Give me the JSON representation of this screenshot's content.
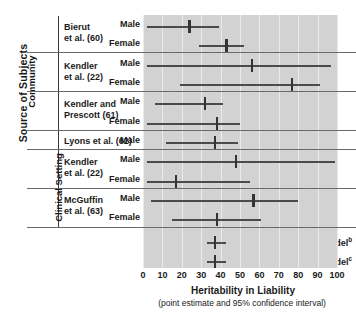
{
  "axes": {
    "y_title": "Source of Subjects",
    "x_title": "Heritability in Liability",
    "x_subtitle": "(point estimate and 95% confidence interval)",
    "x_ticks": [
      "0",
      "10",
      "20",
      "30",
      "40",
      "50",
      "60",
      "70",
      "80",
      "90",
      "100"
    ],
    "x_min": 0,
    "x_max": 100,
    "panel_color": "#d2d2d2",
    "grid_color": "#ebebeb",
    "marker_color": "#333333",
    "line_color": "#4a4a4a"
  },
  "groups": [
    {
      "label": "Community",
      "row_start": 0,
      "row_end": 6
    },
    {
      "label": "Clinical Setting",
      "row_start": 7,
      "row_end": 10
    }
  ],
  "studies": [
    {
      "name": "Bierut\net al. (60)",
      "line1": "Bierut",
      "line2": "et al. (60)",
      "rows": [
        0,
        1
      ]
    },
    {
      "name": "Kendler\net al. (22)",
      "line1": "Kendler",
      "line2": "et al. (22)",
      "rows": [
        2,
        3
      ]
    },
    {
      "name": "Kendler and\nPrescott (61)",
      "line1": "Kendler and",
      "line2": "Prescott (61)",
      "rows": [
        4,
        5
      ]
    },
    {
      "name": "Lyons et al. (62)",
      "line1": "Lyons et al. (62)",
      "line2": "",
      "rows": [
        6
      ]
    },
    {
      "name": "Kendler\net al. (22)",
      "line1": "Kendler",
      "line2": "et al. (22)",
      "rows": [
        7,
        8
      ]
    },
    {
      "name": "McGuffin\net al. (63)",
      "line1": "McGuffin",
      "line2": "et al. (63)",
      "rows": [
        9,
        10
      ]
    }
  ],
  "summary_rows": [
    {
      "label": "Full model",
      "sup": "b"
    },
    {
      "label": "Best-fitting model",
      "sup": "c"
    }
  ],
  "chart_data": {
    "type": "scatter",
    "title": "",
    "xlabel": "Heritability in Liability (point estimate and 95% confidence interval)",
    "ylabel": "Source of Subjects",
    "xlim": [
      0,
      100
    ],
    "x_ticks": [
      0,
      10,
      20,
      30,
      40,
      50,
      60,
      70,
      80,
      90,
      100
    ],
    "grid": "vertical",
    "legend": "none",
    "series": [
      {
        "study": "Bierut et al. (60)",
        "setting": "Community",
        "sex": "Male",
        "estimate": 24,
        "ci_low": 2,
        "ci_high": 39
      },
      {
        "study": "Bierut et al. (60)",
        "setting": "Community",
        "sex": "Female",
        "estimate": 43,
        "ci_low": 29,
        "ci_high": 52
      },
      {
        "study": "Kendler et al. (22)",
        "setting": "Community",
        "sex": "Male",
        "estimate": 56,
        "ci_low": 2,
        "ci_high": 97
      },
      {
        "study": "Kendler et al. (22)",
        "setting": "Community",
        "sex": "Female",
        "estimate": 77,
        "ci_low": 19,
        "ci_high": 91
      },
      {
        "study": "Kendler and Prescott (61)",
        "setting": "Community",
        "sex": "Male",
        "estimate": 32,
        "ci_low": 6,
        "ci_high": 41
      },
      {
        "study": "Kendler and Prescott (61)",
        "setting": "Community",
        "sex": "Female",
        "estimate": 38,
        "ci_low": 2,
        "ci_high": 50
      },
      {
        "study": "Lyons et al. (62)",
        "setting": "Community",
        "sex": "Male",
        "estimate": 37,
        "ci_low": 12,
        "ci_high": 49
      },
      {
        "study": "Kendler et al. (22)",
        "setting": "Clinical Setting",
        "sex": "Male",
        "estimate": 48,
        "ci_low": 2,
        "ci_high": 99
      },
      {
        "study": "Kendler et al. (22)",
        "setting": "Clinical Setting",
        "sex": "Female",
        "estimate": 17,
        "ci_low": 2,
        "ci_high": 55
      },
      {
        "study": "McGuffin et al. (63)",
        "setting": "Clinical Setting",
        "sex": "Male",
        "estimate": 57,
        "ci_low": 4,
        "ci_high": 80
      },
      {
        "study": "McGuffin et al. (63)",
        "setting": "Clinical Setting",
        "sex": "Female",
        "estimate": 38,
        "ci_low": 15,
        "ci_high": 61
      },
      {
        "study": "Full model",
        "setting": "Pooled",
        "sex": "",
        "estimate": 37,
        "ci_low": 33,
        "ci_high": 43
      },
      {
        "study": "Best-fitting model",
        "setting": "Pooled",
        "sex": "",
        "estimate": 37,
        "ci_low": 33,
        "ci_high": 43
      }
    ]
  },
  "layout": {
    "panel_left": 143,
    "panel_top": 15,
    "panel_width": 194,
    "panel_height": 253,
    "row_tops": [
      18,
      37,
      57,
      76,
      95,
      115,
      134,
      153,
      173,
      192,
      211,
      234,
      253
    ],
    "row_height": 19,
    "separators_y": [
      52,
      91,
      130,
      149,
      188,
      227
    ],
    "sex_labels": [
      "Male",
      "Female",
      "Male",
      "Female",
      "Male",
      "Female",
      "Male",
      "Male",
      "Female",
      "Male",
      "Female"
    ]
  }
}
